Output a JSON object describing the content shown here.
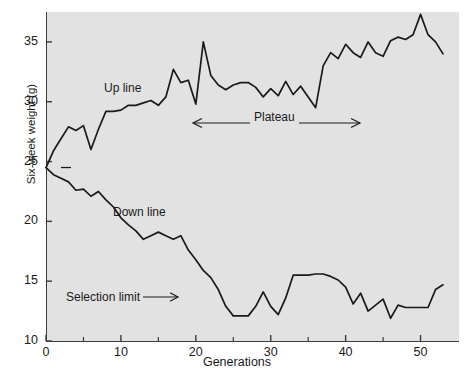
{
  "chart_data": {
    "type": "line",
    "title": "",
    "xlabel": "Generations",
    "ylabel": "Six-week weight (g)",
    "xlim": [
      0,
      55
    ],
    "ylim": [
      10,
      37.5
    ],
    "xticks": [
      0,
      10,
      20,
      30,
      40,
      50
    ],
    "xtick_labels": [
      "0",
      "10",
      "20",
      "30",
      "40",
      "50"
    ],
    "xminor_ticks": [
      5,
      15,
      25,
      35,
      45
    ],
    "yticks": [
      10,
      15,
      20,
      25,
      30,
      35
    ],
    "ytick_labels": [
      "10",
      "15",
      "20",
      "25",
      "30",
      "35"
    ],
    "grid": false,
    "legend": "none",
    "plot_background": "#e2e2e2",
    "line_color": "#1a1a1a",
    "series": [
      {
        "name": "Up line",
        "x": [
          0,
          1,
          2,
          3,
          4,
          5,
          6,
          7,
          8,
          9,
          10,
          11,
          12,
          13,
          14,
          15,
          16,
          17,
          18,
          19,
          20,
          21,
          22,
          23,
          24,
          25,
          26,
          27,
          28,
          29,
          30,
          31,
          32,
          33,
          34,
          35,
          36,
          37,
          38,
          39,
          40,
          41,
          42,
          43,
          44,
          45,
          46,
          47,
          48,
          49,
          50,
          51,
          52,
          53
        ],
        "values": [
          24.5,
          25.9,
          26.9,
          27.9,
          27.6,
          28.0,
          26.0,
          27.7,
          29.2,
          29.2,
          29.3,
          29.7,
          29.7,
          29.9,
          30.1,
          29.7,
          30.4,
          32.7,
          31.6,
          31.8,
          29.8,
          35.0,
          32.2,
          31.4,
          31.0,
          31.4,
          31.6,
          31.6,
          31.2,
          30.4,
          31.1,
          30.5,
          31.7,
          30.6,
          31.3,
          30.4,
          29.5,
          33.0,
          34.1,
          33.6,
          34.8,
          34.1,
          33.7,
          35.0,
          34.1,
          33.8,
          35.1,
          35.4,
          35.2,
          35.6,
          37.3,
          35.6,
          35.0,
          34.0
        ]
      },
      {
        "name": "Down line",
        "x": [
          0,
          1,
          2,
          3,
          4,
          5,
          6,
          7,
          8,
          9,
          10,
          11,
          12,
          13,
          14,
          15,
          16,
          17,
          18,
          19,
          20,
          21,
          22,
          23,
          24,
          25,
          26,
          27,
          28,
          29,
          30,
          31,
          32,
          33,
          34,
          35,
          36,
          37,
          38,
          39,
          40,
          41,
          42,
          43,
          44,
          45,
          46,
          47,
          48,
          49,
          50,
          51,
          52,
          53
        ],
        "values": [
          24.5,
          23.9,
          23.6,
          23.3,
          22.6,
          22.7,
          22.1,
          22.5,
          21.8,
          21.2,
          20.3,
          19.7,
          19.2,
          18.5,
          18.8,
          19.1,
          18.8,
          18.5,
          18.8,
          17.6,
          16.8,
          15.9,
          15.3,
          14.3,
          12.9,
          12.1,
          12.1,
          12.1,
          12.9,
          14.1,
          12.9,
          12.2,
          13.6,
          15.5,
          15.5,
          15.5,
          15.6,
          15.6,
          15.4,
          15.1,
          14.5,
          13.1,
          14.0,
          12.5,
          13.0,
          13.5,
          11.9,
          13.0,
          12.8,
          12.8,
          12.8,
          12.8,
          14.3,
          14.7
        ]
      }
    ],
    "annotations": [
      {
        "id": "up-line-label",
        "text": "Up line"
      },
      {
        "id": "down-line-label",
        "text": "Down line"
      },
      {
        "id": "selection-limit-label",
        "text": "Selection limit"
      },
      {
        "id": "plateau-label",
        "text": "Plateau"
      }
    ],
    "markers": [
      {
        "id": "origin-dash",
        "x": 1.2,
        "y": 24.5,
        "shape": "dash"
      }
    ]
  },
  "labels": {
    "y_axis_title": "Six-week weight (g)",
    "x_axis_title": "Generations",
    "up_line": "Up line",
    "down_line": "Down line",
    "selection_limit": "Selection limit",
    "plateau": "Plateau"
  }
}
